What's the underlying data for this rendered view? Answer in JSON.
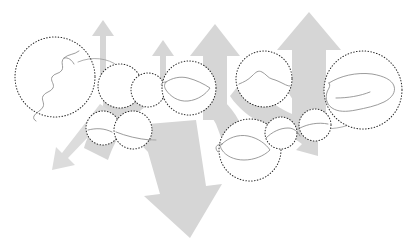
{
  "diagram": {
    "background_color": "#ffffff",
    "arrow_color": "#d6d6d6",
    "circle_stroke_color": "#2b2b2b",
    "region_stroke_color": "#8a8a8a",
    "circle_style": "dotted",
    "node_count": 11,
    "arrow_count": 7
  },
  "nodes": [
    {
      "id": "node-1",
      "label": "region-coastline-large-left",
      "cx": 55,
      "cy": 77,
      "r": 40,
      "shape": "coastline"
    },
    {
      "id": "node-2",
      "label": "region-small-upper-a",
      "cx": 120,
      "cy": 86,
      "r": 22,
      "shape": "blank"
    },
    {
      "id": "node-3",
      "label": "region-small-upper-b",
      "cx": 148,
      "cy": 90,
      "r": 17,
      "shape": "blank"
    },
    {
      "id": "node-4",
      "label": "region-blob-center-left",
      "cx": 189,
      "cy": 88,
      "r": 27,
      "shape": "blob"
    },
    {
      "id": "node-5",
      "label": "region-ridge-center-right",
      "cx": 264,
      "cy": 79,
      "r": 28,
      "shape": "ridge"
    },
    {
      "id": "node-6",
      "label": "region-island-right",
      "cx": 363,
      "cy": 90,
      "r": 39,
      "shape": "island"
    },
    {
      "id": "node-7",
      "label": "region-small-lower-a",
      "cx": 103,
      "cy": 128,
      "r": 17,
      "shape": "line"
    },
    {
      "id": "node-8",
      "label": "region-small-lower-b",
      "cx": 133,
      "cy": 130,
      "r": 19,
      "shape": "line"
    },
    {
      "id": "node-9",
      "label": "region-blob-lower-center",
      "cx": 250,
      "cy": 150,
      "r": 31,
      "shape": "blob-lower"
    },
    {
      "id": "node-10",
      "label": "region-small-lower-c",
      "cx": 281,
      "cy": 133,
      "r": 16,
      "shape": "line"
    },
    {
      "id": "node-11",
      "label": "region-small-lower-d",
      "cx": 315,
      "cy": 125,
      "r": 16,
      "shape": "line"
    }
  ],
  "arrows": [
    {
      "id": "arrow-up-left",
      "label": "upward arrow left",
      "direction": "up",
      "size": "small"
    },
    {
      "id": "arrow-up-mid",
      "label": "upward arrow middle",
      "direction": "up",
      "size": "small"
    },
    {
      "id": "arrow-up-center",
      "label": "upward arrow center",
      "direction": "up",
      "size": "medium"
    },
    {
      "id": "arrow-up-right",
      "label": "upward arrow right",
      "direction": "up",
      "size": "large"
    },
    {
      "id": "arrow-down-main",
      "label": "large downward arrow",
      "direction": "down",
      "size": "large"
    },
    {
      "id": "arrow-down-left",
      "label": "thin down-left arrow",
      "direction": "down-left",
      "size": "small"
    },
    {
      "id": "arrow-down-right",
      "label": "small down-right arrow",
      "direction": "down-right",
      "size": "small"
    }
  ]
}
